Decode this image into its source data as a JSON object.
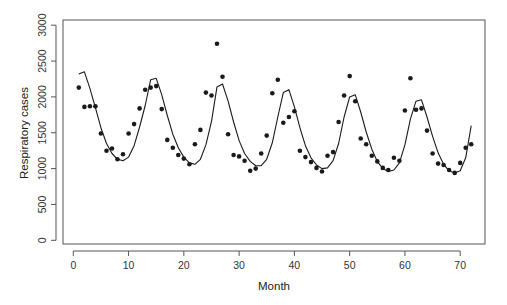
{
  "chart_data": {
    "type": "line",
    "title": "",
    "xlabel": "Month",
    "ylabel": "Respiratory cases",
    "xlim": [
      -2,
      75
    ],
    "ylim": [
      -100,
      3100
    ],
    "x_ticks": [
      0,
      10,
      20,
      30,
      40,
      50,
      60,
      70
    ],
    "y_ticks": [
      0,
      500,
      1000,
      1500,
      2000,
      2500,
      3000
    ],
    "grid": false,
    "legend": null,
    "x": [
      1,
      2,
      3,
      4,
      5,
      6,
      7,
      8,
      9,
      10,
      11,
      12,
      13,
      14,
      15,
      16,
      17,
      18,
      19,
      20,
      21,
      22,
      23,
      24,
      25,
      26,
      27,
      28,
      29,
      30,
      31,
      32,
      33,
      34,
      35,
      36,
      37,
      38,
      39,
      40,
      41,
      42,
      43,
      44,
      45,
      46,
      47,
      48,
      49,
      50,
      51,
      52,
      53,
      54,
      55,
      56,
      57,
      58,
      59,
      60,
      61,
      62,
      63,
      64,
      65,
      66,
      67,
      68,
      69,
      70,
      71,
      72
    ],
    "series": [
      {
        "name": "Observed",
        "style": "points",
        "values": [
          2130,
          1860,
          1870,
          1870,
          1490,
          1250,
          1280,
          1130,
          1200,
          1490,
          1620,
          1840,
          2100,
          2130,
          2150,
          1830,
          1400,
          1290,
          1190,
          1140,
          1060,
          1340,
          1540,
          2060,
          2020,
          2740,
          2280,
          1480,
          1190,
          1170,
          1110,
          970,
          1000,
          1210,
          1460,
          2050,
          2240,
          1640,
          1720,
          1800,
          1250,
          1160,
          1090,
          1010,
          960,
          1180,
          1230,
          1650,
          2020,
          2290,
          1940,
          1420,
          1340,
          1180,
          1100,
          1010,
          980,
          1150,
          1110,
          1810,
          2260,
          1820,
          1840,
          1530,
          1210,
          1070,
          1050,
          980,
          940,
          1080,
          1290,
          1340
        ]
      },
      {
        "name": "Fitted",
        "style": "line",
        "values": [
          2320,
          2350,
          2120,
          1850,
          1570,
          1350,
          1210,
          1130,
          1110,
          1160,
          1320,
          1580,
          1880,
          2240,
          2260,
          2030,
          1740,
          1480,
          1290,
          1160,
          1080,
          1060,
          1130,
          1330,
          1660,
          2140,
          2180,
          1940,
          1650,
          1390,
          1210,
          1100,
          1040,
          1040,
          1130,
          1360,
          1720,
          2060,
          2100,
          1860,
          1570,
          1320,
          1150,
          1050,
          1000,
          1010,
          1110,
          1350,
          1720,
          2000,
          2030,
          1790,
          1510,
          1270,
          1100,
          1000,
          960,
          980,
          1080,
          1330,
          1690,
          1940,
          1960,
          1720,
          1450,
          1220,
          1060,
          970,
          940,
          970,
          1150,
          1600
        ]
      }
    ]
  }
}
